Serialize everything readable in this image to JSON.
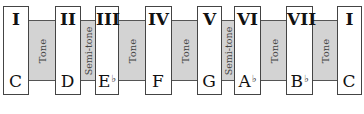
{
  "diagram": {
    "title": "",
    "degrees": [
      {
        "numeral": "I",
        "note": "C",
        "accidental": ""
      },
      {
        "numeral": "II",
        "note": "D",
        "accidental": ""
      },
      {
        "numeral": "III",
        "note": "E",
        "accidental": "♭"
      },
      {
        "numeral": "IV",
        "note": "F",
        "accidental": ""
      },
      {
        "numeral": "V",
        "note": "G",
        "accidental": ""
      },
      {
        "numeral": "VI",
        "note": "A",
        "accidental": "♭"
      },
      {
        "numeral": "VII",
        "note": "B",
        "accidental": "♭"
      },
      {
        "numeral": "I",
        "note": "C",
        "accidental": ""
      }
    ],
    "intervals": [
      {
        "label": "Tone"
      },
      {
        "label": "Semi-tone"
      },
      {
        "label": "Tone"
      },
      {
        "label": "Tone"
      },
      {
        "label": "Semi-tone"
      },
      {
        "label": "Tone"
      },
      {
        "label": "Tone"
      }
    ],
    "colors": {
      "interval_fill": "#d3d3d3",
      "box_fill": "#ffffff",
      "stroke": "#444444"
    }
  }
}
